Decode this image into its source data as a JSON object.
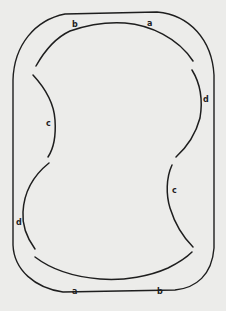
{
  "diagram": {
    "background": "#ececea",
    "stroke_color": "#1e1e1e",
    "outer_boundary": "rounded-rectangle",
    "segments": [
      {
        "id": "top-b-a",
        "labels": [
          "b",
          "a"
        ]
      },
      {
        "id": "right-d",
        "label": "d"
      },
      {
        "id": "right-c",
        "label": "c"
      },
      {
        "id": "bottom-a-b",
        "labels": [
          "a",
          "b"
        ]
      },
      {
        "id": "left-d",
        "label": "d"
      },
      {
        "id": "left-c",
        "label": "c"
      }
    ],
    "labels": {
      "top_b": "b",
      "top_a": "a",
      "right_d": "d",
      "left_c": "c",
      "right_c": "c",
      "left_d": "d",
      "bottom_a": "a",
      "bottom_b": "b"
    }
  }
}
